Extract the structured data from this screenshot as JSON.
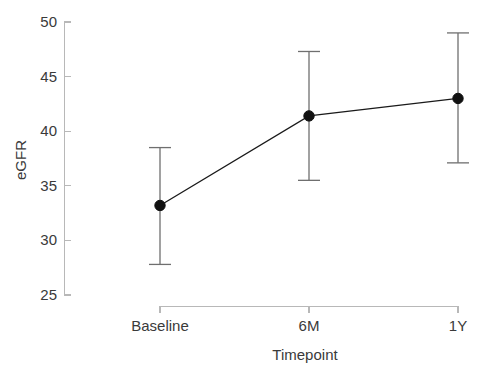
{
  "chart_data": {
    "type": "line",
    "title": "",
    "subtitle": "",
    "xlabel": "Timepoint",
    "ylabel": "eGFR",
    "categories": [
      "Baseline",
      "6M",
      "1Y"
    ],
    "values": [
      33.2,
      41.4,
      43.0
    ],
    "error_low": [
      27.8,
      35.5,
      37.1
    ],
    "error_high": [
      38.5,
      47.3,
      49.0
    ],
    "series": [
      {
        "name": "eGFR",
        "values": [
          33.2,
          41.4,
          43.0
        ],
        "error_low": [
          27.8,
          35.5,
          37.1
        ],
        "error_high": [
          38.5,
          47.3,
          49.0
        ]
      }
    ],
    "ylim": [
      25,
      50
    ],
    "yticks": [
      25,
      30,
      35,
      40,
      45,
      50
    ],
    "ytick_labels": [
      "25",
      "30",
      "35",
      "40",
      "45",
      "50"
    ],
    "xtick_labels": [
      "Baseline",
      "6M",
      "1Y"
    ],
    "grid": false,
    "legend": false,
    "legend_position": "none",
    "marker": "circle",
    "errorbar_style": "capped",
    "colors": {
      "line": "#1a1a1a",
      "marker": "#111111",
      "errorbar": "#6f6f6f",
      "axis": "#b8b8b8",
      "text": "#3a3a3a",
      "background": "#ffffff"
    }
  },
  "axes": {
    "y_title": "eGFR",
    "x_title": "Timepoint",
    "y_tick_0": "25",
    "y_tick_1": "30",
    "y_tick_2": "35",
    "y_tick_3": "40",
    "y_tick_4": "45",
    "y_tick_5": "50",
    "x_tick_0": "Baseline",
    "x_tick_1": "6M",
    "x_tick_2": "1Y"
  }
}
